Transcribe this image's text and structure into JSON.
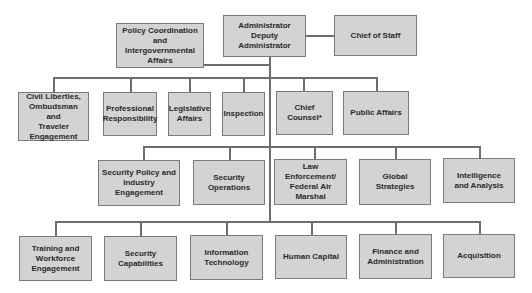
{
  "chart": {
    "colors": {
      "box_fill": "#d3d3d3",
      "box_border": "#7a7a7a",
      "line": "#6e6e6e",
      "text": "#2a2a2a"
    },
    "top": {
      "administrator": "Administrator\nDeputy Administrator",
      "chief_of_staff": "Chief of Staff",
      "policy_coordination": "Policy Coordination and\nIntergovernmental\nAffairs"
    },
    "row1": [
      "Civil Liberties,\nOmbudsman and\nTraveler\nEngagement",
      "Professional\nResponsibility",
      "Legislative\nAffairs",
      "Inspection",
      "Chief Counsel*",
      "Public Affairs"
    ],
    "row2": [
      "Security Policy and\nIndustry Engagement",
      "Security Operations",
      "Law Enforcement/\nFederal Air Marshal",
      "Global Strategies",
      "Intelligence\nand Analysis"
    ],
    "row3": [
      "Training and\nWorkforce\nEngagement",
      "Security\nCapabilities",
      "Information\nTechnology",
      "Human Capital",
      "Finance and\nAdministration",
      "Acquisition"
    ]
  }
}
